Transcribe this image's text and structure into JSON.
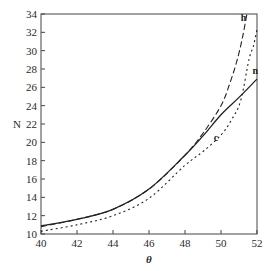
{
  "chart_data": {
    "type": "line",
    "title": "",
    "xlabel": "θ",
    "ylabel": "N",
    "xlim": [
      40,
      52
    ],
    "ylim": [
      10,
      34
    ],
    "xticks": [
      40,
      42,
      44,
      46,
      48,
      50,
      52
    ],
    "yticks": [
      10,
      12,
      14,
      16,
      18,
      20,
      22,
      24,
      26,
      28,
      30,
      32,
      34
    ],
    "grid": false,
    "legend": "none (curves labeled inline)",
    "series": [
      {
        "name": "n",
        "style": "solid",
        "x": [
          40,
          42,
          44,
          46,
          48,
          49,
          50,
          51,
          52
        ],
        "y": [
          10.9,
          11.6,
          12.7,
          14.9,
          18.6,
          20.7,
          23.0,
          24.9,
          26.9
        ]
      },
      {
        "name": "h",
        "style": "dashed",
        "x": [
          40,
          42,
          44,
          46,
          48,
          49,
          50,
          50.5,
          50.9,
          51.2,
          51.44
        ],
        "y": [
          10.8,
          11.6,
          12.7,
          14.9,
          18.6,
          21.0,
          24.0,
          26.5,
          29.0,
          31.5,
          34.0
        ]
      },
      {
        "name": "c",
        "style": "dotted",
        "x": [
          40,
          42,
          44,
          46,
          48,
          49,
          50,
          50.6,
          51.1,
          51.55,
          51.8,
          52
        ],
        "y": [
          10.3,
          11.0,
          12.0,
          13.9,
          17.5,
          19.0,
          20.8,
          22.5,
          24.6,
          29.0,
          30.5,
          32.3
        ]
      }
    ],
    "annotations": [
      {
        "text": "h",
        "x": 51.1,
        "y": 33.2
      },
      {
        "text": "n",
        "x": 51.75,
        "y": 27.5
      },
      {
        "text": "c",
        "x": 49.6,
        "y": 20.2
      }
    ]
  }
}
